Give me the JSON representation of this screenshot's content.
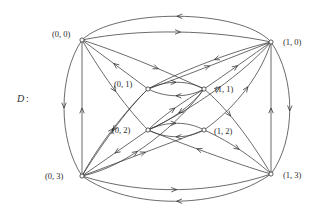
{
  "figure": {
    "name": "D",
    "separator": ":",
    "type": "directed-graph"
  },
  "nodes": [
    {
      "id": "n00",
      "label": "(0, 0)",
      "x": 82,
      "y": 40,
      "label_x": 52,
      "label_y": 37,
      "anchor": "start"
    },
    {
      "id": "n10",
      "label": "(1, 0)",
      "x": 271,
      "y": 42,
      "label_x": 283,
      "label_y": 45,
      "anchor": "start"
    },
    {
      "id": "n01",
      "label": "(0, 1)",
      "x": 148,
      "y": 89,
      "label_x": 114,
      "label_y": 87,
      "anchor": "start"
    },
    {
      "id": "n11",
      "label": "(1, 1)",
      "x": 204,
      "y": 89,
      "label_x": 215,
      "label_y": 92,
      "anchor": "start"
    },
    {
      "id": "n02",
      "label": "(0, 2)",
      "x": 148,
      "y": 130,
      "label_x": 112,
      "label_y": 133,
      "anchor": "start"
    },
    {
      "id": "n12",
      "label": "(1, 2)",
      "x": 204,
      "y": 130,
      "label_x": 214,
      "label_y": 134,
      "anchor": "start"
    },
    {
      "id": "n03",
      "label": "(0, 3)",
      "x": 82,
      "y": 176,
      "label_x": 45,
      "label_y": 179,
      "anchor": "start"
    },
    {
      "id": "n13",
      "label": "(1, 3)",
      "x": 271,
      "y": 174,
      "label_x": 283,
      "label_y": 178,
      "anchor": "start"
    }
  ],
  "edges": [
    {
      "from": "(1, 0)",
      "to": "(0, 0)",
      "path": "M271,42 C240,8 115,8 82,40",
      "arrow_t": 0.5,
      "name": "edge-10-to-00-outer-top"
    },
    {
      "from": "(0, 0)",
      "to": "(1, 0)",
      "path": "M82,40 C140,28 215,30 271,42",
      "arrow_t": 0.52,
      "name": "edge-00-to-10-inner-top"
    },
    {
      "from": "(0, 0)",
      "to": "(0, 3)",
      "path": "M82,40 C58,75 58,140 82,176",
      "arrow_t": 0.5,
      "name": "edge-00-to-03-left-arc"
    },
    {
      "from": "(0, 3)",
      "to": "(0, 0)",
      "path": "M82,176 L82,40",
      "arrow_t": 0.5,
      "name": "edge-03-to-00-left-straight"
    },
    {
      "from": "(1, 0)",
      "to": "(1, 3)",
      "path": "M271,42 C296,78 296,140 271,174",
      "arrow_t": 0.52,
      "name": "edge-10-to-13-right-arc"
    },
    {
      "from": "(1, 3)",
      "to": "(1, 0)",
      "path": "M271,174 L271,42",
      "arrow_t": 0.5,
      "name": "edge-13-to-10-right-straight"
    },
    {
      "from": "(0, 3)",
      "to": "(1, 3)",
      "path": "M82,176 C145,196 215,193 271,174",
      "arrow_t": 0.5,
      "name": "edge-03-to-13-bottom-mid"
    },
    {
      "from": "(1, 3)",
      "to": "(0, 3)",
      "path": "M271,174 C220,210 130,210 82,176",
      "arrow_t": 0.5,
      "name": "edge-13-to-03-bottom-outer"
    },
    {
      "from": "(0, 1)",
      "to": "(1, 1)",
      "path": "M148,89 C166,80 188,80 204,89",
      "arrow_t": 0.5,
      "name": "edge-01-to-11-upper"
    },
    {
      "from": "(1, 1)",
      "to": "(0, 1)",
      "path": "M204,89 C188,98 166,98 148,89",
      "arrow_t": 0.5,
      "name": "edge-11-to-01-lower"
    },
    {
      "from": "(0, 2)",
      "to": "(1, 2)",
      "path": "M148,130 C166,121 188,121 204,130",
      "arrow_t": 0.5,
      "name": "edge-02-to-12-upper"
    },
    {
      "from": "(1, 2)",
      "to": "(0, 2)",
      "path": "M204,130 C188,139 166,139 148,130",
      "arrow_t": 0.5,
      "name": "edge-12-to-02-lower"
    },
    {
      "from": "(0, 1)",
      "to": "(0, 0)",
      "path": "M148,89 L82,40",
      "arrow_t": 0.52,
      "name": "edge-01-to-00"
    },
    {
      "from": "(0, 0)",
      "to": "(0, 2)",
      "path": "M82,40 C104,78 130,112 148,130",
      "arrow_t": 0.55,
      "name": "edge-00-to-02"
    },
    {
      "from": "(0, 2)",
      "to": "(1, 1)",
      "path": "M148,130 C162,116 186,100 204,89",
      "arrow_t": 0.5,
      "name": "edge-02-to-11"
    },
    {
      "from": "(1, 1)",
      "to": "(0, 2)",
      "path": "M204,89 C192,106 168,122 148,130",
      "arrow_t": 0.5,
      "name": "edge-11-to-02"
    },
    {
      "from": "(0, 1)",
      "to": "(1, 0)",
      "path": "M148,89 C185,76 240,54 271,42",
      "arrow_t": 0.5,
      "name": "edge-01-to-10"
    },
    {
      "from": "(1, 0)",
      "to": "(0, 1)",
      "path": "M271,42 C236,50 178,72 148,89",
      "arrow_t": 0.45,
      "name": "edge-10-to-01"
    },
    {
      "from": "(1, 1)",
      "to": "(1, 0)",
      "path": "M204,89 C226,74 254,54 271,42",
      "arrow_t": 0.5,
      "name": "edge-11-to-10"
    },
    {
      "from": "(0, 2)",
      "to": "(1, 0)",
      "path": "M148,130 C192,110 245,72 271,42",
      "arrow_t": 0.55,
      "name": "edge-02-to-10"
    },
    {
      "from": "(1, 2)",
      "to": "(1, 0)",
      "path": "M204,130 C238,106 262,72 271,42",
      "arrow_t": 0.55,
      "name": "edge-12-to-10"
    },
    {
      "from": "(0, 0)",
      "to": "(1, 1)",
      "path": "M82,40 C126,54 176,76 204,89",
      "arrow_t": 0.62,
      "name": "edge-00-to-11"
    },
    {
      "from": "(0, 3)",
      "to": "(0, 1)",
      "path": "M82,176 C100,142 130,106 148,89",
      "arrow_t": 0.52,
      "name": "edge-03-to-01"
    },
    {
      "from": "(0, 1)",
      "to": "(0, 3)",
      "path": "M148,89 C126,110 98,150 82,176",
      "arrow_t": 0.5,
      "name": "edge-01-to-03"
    },
    {
      "from": "(0, 2)",
      "to": "(0, 3)",
      "path": "M148,130 L82,176",
      "arrow_t": 0.5,
      "name": "edge-02-to-03"
    },
    {
      "from": "(0, 3)",
      "to": "(1, 2)",
      "path": "M82,176 C130,158 178,140 204,130",
      "arrow_t": 0.52,
      "name": "edge-03-to-12"
    },
    {
      "from": "(0, 3)",
      "to": "(1, 1)",
      "path": "M82,176 C130,166 180,122 204,89",
      "arrow_t": 0.4,
      "name": "edge-03-to-11"
    },
    {
      "from": "(1, 2)",
      "to": "(1, 3)",
      "path": "M204,130 C232,142 258,162 271,174",
      "arrow_t": 0.5,
      "name": "edge-12-to-13"
    },
    {
      "from": "(1, 1)",
      "to": "(1, 3)",
      "path": "M204,89 C232,112 258,152 271,174",
      "arrow_t": 0.35,
      "name": "edge-11-to-13"
    },
    {
      "from": "(1, 3)",
      "to": "(0, 2)",
      "path": "M271,174 C236,164 178,142 148,130",
      "arrow_t": 0.6,
      "name": "edge-13-to-02"
    }
  ],
  "style": {
    "edge_color": "#3a3a3a",
    "node_fill": "#ffffff",
    "node_stroke": "#333333",
    "text_color": "#2d2d2d",
    "background": "#ffffff"
  }
}
